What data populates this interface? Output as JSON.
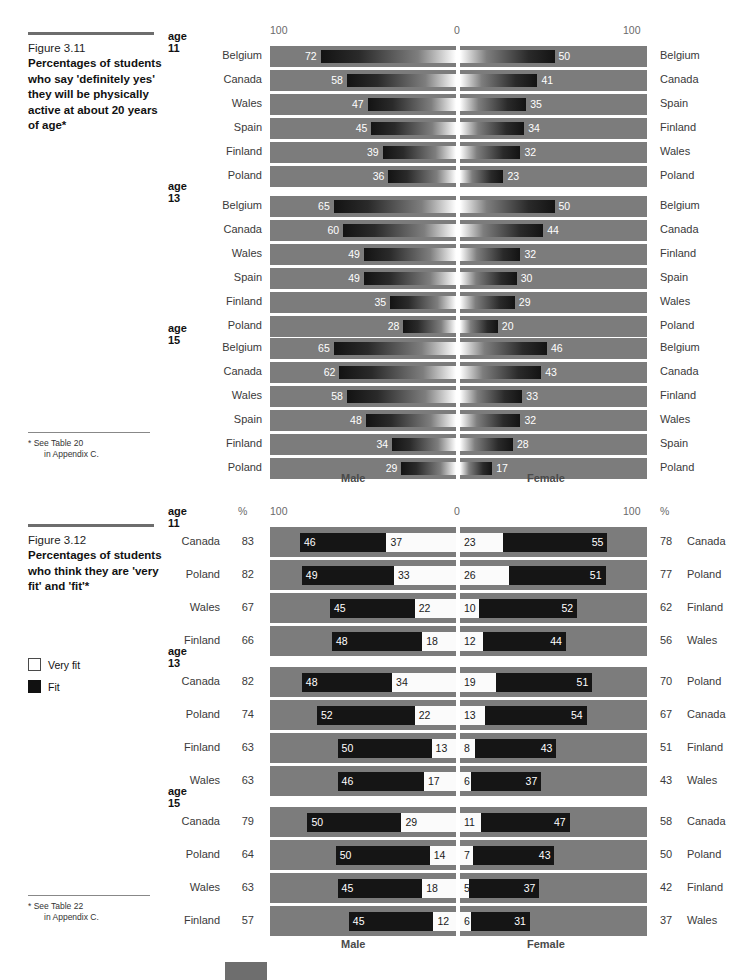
{
  "figure_311": {
    "caption_number": "Figure 3.11",
    "caption_title": "Percentages of students who say 'definitely yes' they will be physically active at about 20 years of age*",
    "footnote_marker": "*",
    "footnote_line1": "See Table 20",
    "footnote_line2": "in Appendix C.",
    "axis_left_label": "100",
    "axis_center_label": "0",
    "axis_right_label": "100",
    "male_label": "Male",
    "female_label": "Female",
    "groups": [
      {
        "age": "age 11",
        "rows": [
          {
            "left_country": "Belgium",
            "left_value": 72,
            "right_value": 50,
            "right_country": "Belgium"
          },
          {
            "left_country": "Canada",
            "left_value": 58,
            "right_value": 41,
            "right_country": "Canada"
          },
          {
            "left_country": "Wales",
            "left_value": 47,
            "right_value": 35,
            "right_country": "Spain"
          },
          {
            "left_country": "Spain",
            "left_value": 45,
            "right_value": 34,
            "right_country": "Finland"
          },
          {
            "left_country": "Finland",
            "left_value": 39,
            "right_value": 32,
            "right_country": "Wales"
          },
          {
            "left_country": "Poland",
            "left_value": 36,
            "right_value": 23,
            "right_country": "Poland"
          }
        ]
      },
      {
        "age": "age 13",
        "rows": [
          {
            "left_country": "Belgium",
            "left_value": 65,
            "right_value": 50,
            "right_country": "Belgium"
          },
          {
            "left_country": "Canada",
            "left_value": 60,
            "right_value": 44,
            "right_country": "Canada"
          },
          {
            "left_country": "Wales",
            "left_value": 49,
            "right_value": 32,
            "right_country": "Finland"
          },
          {
            "left_country": "Spain",
            "left_value": 49,
            "right_value": 30,
            "right_country": "Spain"
          },
          {
            "left_country": "Finland",
            "left_value": 35,
            "right_value": 29,
            "right_country": "Wales"
          },
          {
            "left_country": "Poland",
            "left_value": 28,
            "right_value": 20,
            "right_country": "Poland"
          }
        ]
      },
      {
        "age": "age 15",
        "rows": [
          {
            "left_country": "Belgium",
            "left_value": 65,
            "right_value": 46,
            "right_country": "Belgium"
          },
          {
            "left_country": "Canada",
            "left_value": 62,
            "right_value": 43,
            "right_country": "Canada"
          },
          {
            "left_country": "Wales",
            "left_value": 58,
            "right_value": 33,
            "right_country": "Finland"
          },
          {
            "left_country": "Spain",
            "left_value": 48,
            "right_value": 32,
            "right_country": "Wales"
          },
          {
            "left_country": "Finland",
            "left_value": 34,
            "right_value": 28,
            "right_country": "Spain"
          },
          {
            "left_country": "Poland",
            "left_value": 29,
            "right_value": 17,
            "right_country": "Poland"
          }
        ]
      }
    ]
  },
  "figure_312": {
    "caption_number": "Figure 3.12",
    "caption_title": "Percentages of students who think they are 'very fit' and 'fit'*",
    "footnote_marker": "*",
    "footnote_line1": "See Table 22",
    "footnote_line2": "in Appendix C.",
    "legend": [
      {
        "label": "Very fit",
        "swatch": "very-fit",
        "color": "#ffffff"
      },
      {
        "label": "Fit",
        "swatch": "fit",
        "color": "#111111"
      }
    ],
    "percent_symbol_left": "%",
    "percent_symbol_right": "%",
    "axis_left_label": "100",
    "axis_center_label": "0",
    "axis_right_label": "100",
    "male_label": "Male",
    "female_label": "Female",
    "groups": [
      {
        "age": "age 11",
        "rows": [
          {
            "left_country": "Canada",
            "left_total": 83,
            "left_fit": 46,
            "left_veryfit": 37,
            "right_veryfit": 23,
            "right_fit": 55,
            "right_total": 78,
            "right_country": "Canada"
          },
          {
            "left_country": "Poland",
            "left_total": 82,
            "left_fit": 49,
            "left_veryfit": 33,
            "right_veryfit": 26,
            "right_fit": 51,
            "right_total": 77,
            "right_country": "Poland"
          },
          {
            "left_country": "Wales",
            "left_total": 67,
            "left_fit": 45,
            "left_veryfit": 22,
            "right_veryfit": 10,
            "right_fit": 52,
            "right_total": 62,
            "right_country": "Finland"
          },
          {
            "left_country": "Finland",
            "left_total": 66,
            "left_fit": 48,
            "left_veryfit": 18,
            "right_veryfit": 12,
            "right_fit": 44,
            "right_total": 56,
            "right_country": "Wales"
          }
        ]
      },
      {
        "age": "age 13",
        "rows": [
          {
            "left_country": "Canada",
            "left_total": 82,
            "left_fit": 48,
            "left_veryfit": 34,
            "right_veryfit": 19,
            "right_fit": 51,
            "right_total": 70,
            "right_country": "Poland"
          },
          {
            "left_country": "Poland",
            "left_total": 74,
            "left_fit": 52,
            "left_veryfit": 22,
            "right_veryfit": 13,
            "right_fit": 54,
            "right_total": 67,
            "right_country": "Canada"
          },
          {
            "left_country": "Finland",
            "left_total": 63,
            "left_fit": 50,
            "left_veryfit": 13,
            "right_veryfit": 8,
            "right_fit": 43,
            "right_total": 51,
            "right_country": "Finland"
          },
          {
            "left_country": "Wales",
            "left_total": 63,
            "left_fit": 46,
            "left_veryfit": 17,
            "right_veryfit": 6,
            "right_fit": 37,
            "right_total": 43,
            "right_country": "Wales"
          }
        ]
      },
      {
        "age": "age 15",
        "rows": [
          {
            "left_country": "Canada",
            "left_total": 79,
            "left_fit": 50,
            "left_veryfit": 29,
            "right_veryfit": 11,
            "right_fit": 47,
            "right_total": 58,
            "right_country": "Canada"
          },
          {
            "left_country": "Poland",
            "left_total": 64,
            "left_fit": 50,
            "left_veryfit": 14,
            "right_veryfit": 7,
            "right_fit": 43,
            "right_total": 50,
            "right_country": "Poland"
          },
          {
            "left_country": "Wales",
            "left_total": 63,
            "left_fit": 45,
            "left_veryfit": 18,
            "right_veryfit": 5,
            "right_fit": 37,
            "right_total": 42,
            "right_country": "Finland"
          },
          {
            "left_country": "Finland",
            "left_total": 57,
            "left_fit": 45,
            "left_veryfit": 12,
            "right_veryfit": 6,
            "right_fit": 31,
            "right_total": 37,
            "right_country": "Wales"
          }
        ]
      }
    ]
  },
  "chart_data": [
    {
      "type": "bar",
      "id": "figure-3.11",
      "orientation": "horizontal-diverging",
      "title": "Percentages of students who say 'definitely yes' they will be physically active at about 20 years of age",
      "xlabel": "",
      "ylabel": "",
      "xlim": [
        0,
        100
      ],
      "grid": false,
      "legend_position": "none",
      "sides": [
        "Male",
        "Female"
      ],
      "panels": [
        {
          "panel": "age 11",
          "male": {
            "categories": [
              "Belgium",
              "Canada",
              "Wales",
              "Spain",
              "Finland",
              "Poland"
            ],
            "values": [
              72,
              58,
              47,
              45,
              39,
              36
            ]
          },
          "female": {
            "categories": [
              "Belgium",
              "Canada",
              "Spain",
              "Finland",
              "Wales",
              "Poland"
            ],
            "values": [
              50,
              41,
              35,
              34,
              32,
              23
            ]
          }
        },
        {
          "panel": "age 13",
          "male": {
            "categories": [
              "Belgium",
              "Canada",
              "Wales",
              "Spain",
              "Finland",
              "Poland"
            ],
            "values": [
              65,
              60,
              49,
              49,
              35,
              28
            ]
          },
          "female": {
            "categories": [
              "Belgium",
              "Canada",
              "Finland",
              "Spain",
              "Wales",
              "Poland"
            ],
            "values": [
              50,
              44,
              32,
              30,
              29,
              20
            ]
          }
        },
        {
          "panel": "age 15",
          "male": {
            "categories": [
              "Belgium",
              "Canada",
              "Wales",
              "Spain",
              "Finland",
              "Poland"
            ],
            "values": [
              65,
              62,
              58,
              48,
              34,
              29
            ]
          },
          "female": {
            "categories": [
              "Belgium",
              "Canada",
              "Finland",
              "Wales",
              "Spain",
              "Poland"
            ],
            "values": [
              46,
              43,
              33,
              32,
              28,
              17
            ]
          }
        }
      ]
    },
    {
      "type": "bar",
      "id": "figure-3.12",
      "orientation": "horizontal-diverging-stacked",
      "title": "Percentages of students who think they are 'very fit' and 'fit'",
      "xlabel": "%",
      "ylabel": "",
      "xlim": [
        0,
        100
      ],
      "grid": false,
      "legend_position": "left",
      "series": [
        {
          "name": "Very fit",
          "color": "#ffffff"
        },
        {
          "name": "Fit",
          "color": "#111111"
        }
      ],
      "sides": [
        "Male",
        "Female"
      ],
      "panels": [
        {
          "panel": "age 11",
          "male": {
            "categories": [
              "Canada",
              "Poland",
              "Wales",
              "Finland"
            ],
            "totals": [
              83,
              82,
              67,
              66
            ],
            "fit": [
              46,
              49,
              45,
              48
            ],
            "very_fit": [
              37,
              33,
              22,
              18
            ]
          },
          "female": {
            "categories": [
              "Canada",
              "Poland",
              "Finland",
              "Wales"
            ],
            "totals": [
              78,
              77,
              62,
              56
            ],
            "very_fit": [
              23,
              26,
              10,
              12
            ],
            "fit": [
              55,
              51,
              52,
              44
            ]
          }
        },
        {
          "panel": "age 13",
          "male": {
            "categories": [
              "Canada",
              "Poland",
              "Finland",
              "Wales"
            ],
            "totals": [
              82,
              74,
              63,
              63
            ],
            "fit": [
              48,
              52,
              50,
              46
            ],
            "very_fit": [
              34,
              22,
              13,
              17
            ]
          },
          "female": {
            "categories": [
              "Poland",
              "Canada",
              "Finland",
              "Wales"
            ],
            "totals": [
              70,
              67,
              51,
              43
            ],
            "very_fit": [
              19,
              13,
              8,
              6
            ],
            "fit": [
              51,
              54,
              43,
              37
            ]
          }
        },
        {
          "panel": "age 15",
          "male": {
            "categories": [
              "Canada",
              "Poland",
              "Wales",
              "Finland"
            ],
            "totals": [
              79,
              64,
              63,
              57
            ],
            "fit": [
              50,
              50,
              45,
              45
            ],
            "very_fit": [
              29,
              14,
              18,
              12
            ]
          },
          "female": {
            "categories": [
              "Canada",
              "Poland",
              "Finland",
              "Wales"
            ],
            "totals": [
              58,
              50,
              42,
              37
            ],
            "very_fit": [
              11,
              7,
              5,
              6
            ],
            "fit": [
              47,
              43,
              37,
              31
            ]
          }
        }
      ]
    }
  ]
}
